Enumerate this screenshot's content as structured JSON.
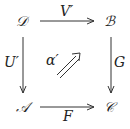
{
  "diagram": {
    "type": "commutative-square",
    "objects": {
      "top_left": "𝒟",
      "top_right": "ℬ",
      "bottom_left": "𝒜",
      "bottom_right": "𝒞"
    },
    "morphisms": {
      "top": "V′",
      "left": "U′",
      "right": "G",
      "bottom": "F"
    },
    "two_cell": "α′"
  }
}
